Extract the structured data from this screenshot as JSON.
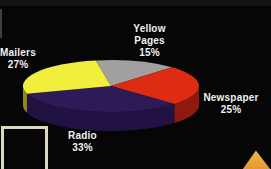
{
  "background_color": "#060606",
  "chart_data": {
    "type": "pie",
    "style": "3d",
    "title": "",
    "legend": "none",
    "labels_position": "outside",
    "geometry": {
      "cx": 111,
      "cy": 86,
      "rx": 88,
      "ry": 26,
      "depth": 19
    },
    "slices": [
      {
        "id": "yellow-pages",
        "name": "Yellow Pages",
        "label": "Yellow\nPages",
        "value": 15,
        "pct_label": "15%",
        "color": "#a1a09e",
        "side_color": "#6f6e6c",
        "start_deg": 46,
        "end_deg": 100
      },
      {
        "id": "newspaper",
        "name": "Newspaper",
        "label": "Newspaper",
        "value": 25,
        "pct_label": "25%",
        "color": "#dd2c12",
        "side_color": "#8e1a0e",
        "start_deg": 316,
        "end_deg": 406
      },
      {
        "id": "radio",
        "name": "Radio",
        "label": "Radio",
        "value": 33,
        "pct_label": "33%",
        "color": "#2d1b58",
        "side_color": "#221243",
        "start_deg": 197.2,
        "end_deg": 316
      },
      {
        "id": "mailers",
        "name": "Mailers",
        "label": "Mailers",
        "value": 27,
        "pct_label": "27%",
        "color": "#f1ee3d",
        "side_color": "#8f8c10",
        "start_deg": 100,
        "end_deg": 197.2
      }
    ]
  },
  "decorations": {
    "frame_color": "#ded8c0",
    "arrow_color": "#eda431",
    "label_text_color": "#f2f2f2"
  }
}
